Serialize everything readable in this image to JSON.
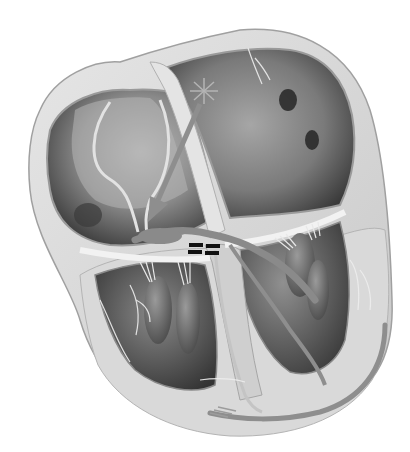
{
  "figure": {
    "style": "grayscale anatomical illustration",
    "width": 410,
    "height": 452
  },
  "structures": {
    "right_atrium": "left chamber, upper",
    "left_atrium": "right chamber, upper",
    "right_ventricle": "lower left chamber",
    "left_ventricle": "lower right chamber",
    "sa_node_marker": "star-icon",
    "conduction_arrow": "arrow-icon",
    "block_marker": "double-bar (=) icon",
    "purkinje_arrow": "bottom curved arrow"
  },
  "colors": {
    "background": "#ffffff",
    "wall": "#d4d4d4",
    "wall_edge": "#a8a8a8",
    "chamber_dark": "#4a4a4a",
    "chamber_mid": "#7c7c7c",
    "chamber_light": "#b8b8b8",
    "pathway": "#8c8c8c",
    "block_mark": "#111111"
  }
}
